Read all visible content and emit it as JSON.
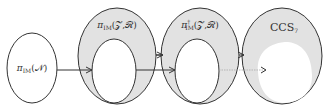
{
  "diagram": {
    "nodes": [
      {
        "id": "n1",
        "label_main": "π",
        "label_sub": "IM",
        "label_sup": "",
        "label_args": "(𝒩)",
        "fill": "#ffffff",
        "stroke": "#333333"
      },
      {
        "id": "n2",
        "label_main": "π",
        "label_sub": "IM",
        "label_sup": "",
        "label_args": "(𝒵,ℛ)",
        "fill": "#e2e2e2",
        "stroke": "#333333"
      },
      {
        "id": "n3",
        "label_main": "π",
        "label_sub": "IM",
        "label_sup": "†",
        "label_args": "(𝒵,ℛ)",
        "fill": "#e2e2e2",
        "stroke": "#333333"
      },
      {
        "id": "n4",
        "label_main": "CCS",
        "label_sub": "7",
        "label_sup": "",
        "label_args": "",
        "fill": "#e2e2e2",
        "stroke": "#333333"
      }
    ],
    "edges": [
      {
        "from": "n1",
        "to": "n2-inner",
        "style": "solid"
      },
      {
        "from": "n2",
        "to": "n3",
        "style": "solid"
      },
      {
        "from": "n2-inner",
        "to": "n3-inner",
        "style": "solid"
      },
      {
        "from": "n3",
        "to": "n4",
        "style": "solid"
      },
      {
        "from": "n3-inner",
        "to": "n4-inner",
        "style": "dotted"
      }
    ],
    "colors": {
      "stroke": "#333333",
      "shade": "#e2e2e2",
      "faint_edge": "#aaaaaa"
    }
  }
}
